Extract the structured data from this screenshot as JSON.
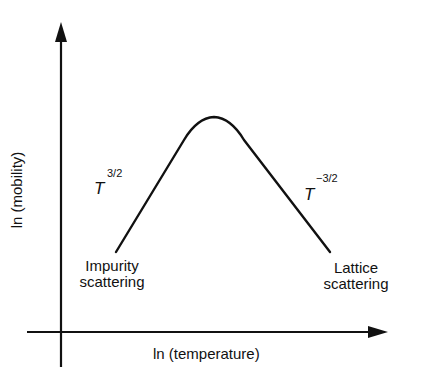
{
  "axes": {
    "x_label": "ln (temperature)",
    "y_label": "ln (mobility)"
  },
  "curve": {
    "left_slope": {
      "base": "T",
      "exponent": "3/2"
    },
    "right_slope": {
      "base": "T",
      "exponent": "−3/2"
    }
  },
  "annotations": {
    "left": {
      "line1": "Impurity",
      "line2": "scattering"
    },
    "right": {
      "line1": "Lattice",
      "line2": "scattering"
    }
  },
  "colors": {
    "stroke": "#111111",
    "background": "#ffffff"
  }
}
